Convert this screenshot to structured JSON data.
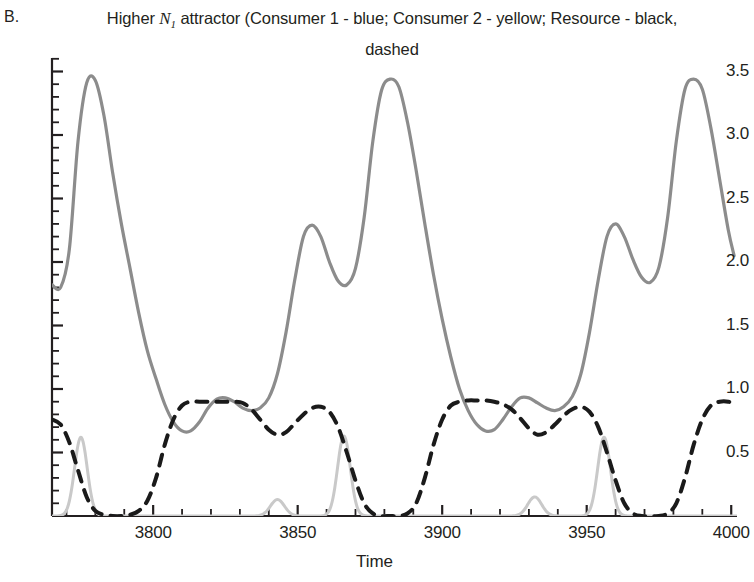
{
  "figure": {
    "panel_label": "B.",
    "title_line1_pre": "Higher ",
    "title_var": "N",
    "title_var_sub": "1",
    "title_line1_post": " attractor (Consumer 1 - blue; Consumer 2 - yellow; Resource -",
    "title_line2": "black, dashed"
  },
  "chart_data": {
    "type": "line",
    "title": "Higher N1 attractor (Consumer 1 - blue; Consumer 2 - yellow; Resource - black, dashed",
    "xlabel": "Time",
    "ylabel": "",
    "xlim": [
      3765,
      4002
    ],
    "ylim": [
      0,
      3.62
    ],
    "grid": false,
    "legend_position": "none",
    "xticks": [
      3800,
      3850,
      3900,
      3950,
      4000
    ],
    "xtick_labels": [
      "3800",
      "3850",
      "3900",
      "3950",
      "4000"
    ],
    "xminor_step": 10,
    "yticks": [
      0.5,
      1.0,
      1.5,
      2.0,
      2.5,
      3.0,
      3.5
    ],
    "ytick_labels": [
      "0.5",
      "1.0",
      "1.5",
      "2.0",
      "2.5",
      "3.0",
      "3.5"
    ],
    "yminor_step": 0.1,
    "colors": {
      "consumer1": "#8c8c8c",
      "consumer2": "#c9c9c9",
      "resource": "#1a1a1a",
      "axis": "#231f20"
    },
    "series": [
      {
        "name": "Consumer 1",
        "legend_color_name": "blue",
        "render_color": "#8c8c8c",
        "style": "solid",
        "linewidth": 3.2,
        "x": [
          3765,
          3768,
          3771,
          3774,
          3777,
          3780,
          3783,
          3786,
          3789,
          3792,
          3795,
          3798,
          3801,
          3804,
          3807,
          3810,
          3813,
          3816,
          3819,
          3822,
          3825,
          3828,
          3831,
          3834,
          3837,
          3840,
          3843,
          3846,
          3849,
          3852,
          3855,
          3858,
          3861,
          3864,
          3867,
          3870,
          3873,
          3876,
          3879,
          3882,
          3885,
          3888,
          3891,
          3894,
          3897,
          3900,
          3903,
          3906,
          3909,
          3912,
          3915,
          3918,
          3921,
          3924,
          3927,
          3930,
          3933,
          3936,
          3939,
          3942,
          3945,
          3948,
          3951,
          3954,
          3957,
          3960,
          3963,
          3966,
          3969,
          3972,
          3975,
          3978,
          3981,
          3984,
          3987,
          3990,
          3993,
          3996,
          3999,
          4001
        ],
        "y": [
          1.82,
          1.8,
          2.1,
          2.95,
          3.41,
          3.43,
          3.15,
          2.7,
          2.3,
          1.95,
          1.6,
          1.3,
          1.08,
          0.88,
          0.74,
          0.67,
          0.67,
          0.74,
          0.85,
          0.92,
          0.93,
          0.9,
          0.85,
          0.83,
          0.85,
          0.93,
          1.12,
          1.45,
          1.86,
          2.2,
          2.29,
          2.2,
          2.0,
          1.85,
          1.82,
          1.95,
          2.35,
          2.95,
          3.35,
          3.44,
          3.38,
          3.1,
          2.72,
          2.3,
          1.9,
          1.55,
          1.25,
          1.0,
          0.83,
          0.72,
          0.67,
          0.68,
          0.76,
          0.86,
          0.93,
          0.93,
          0.89,
          0.85,
          0.83,
          0.86,
          0.94,
          1.12,
          1.45,
          1.86,
          2.2,
          2.3,
          2.2,
          2.02,
          1.88,
          1.84,
          1.96,
          2.35,
          2.95,
          3.36,
          3.44,
          3.36,
          3.05,
          2.65,
          2.25,
          2.05
        ]
      },
      {
        "name": "Consumer 2",
        "legend_color_name": "yellow",
        "render_color": "#c9c9c9",
        "style": "solid",
        "linewidth": 3.0,
        "peaks": [
          {
            "x": 3775,
            "y": 0.62
          },
          {
            "x": 3843,
            "y": 0.13
          },
          {
            "x": 3866,
            "y": 0.63
          },
          {
            "x": 3932,
            "y": 0.15
          },
          {
            "x": 3956,
            "y": 0.62
          }
        ],
        "baseline": 0.0
      },
      {
        "name": "Resource",
        "legend_color_name": "black, dashed",
        "render_color": "#1a1a1a",
        "style": "dashed",
        "dasharray": "11 9",
        "linewidth": 4.0,
        "x": [
          3765,
          3768,
          3771,
          3774,
          3777,
          3780,
          3783,
          3786,
          3789,
          3792,
          3795,
          3798,
          3801,
          3804,
          3807,
          3810,
          3813,
          3816,
          3819,
          3822,
          3825,
          3828,
          3831,
          3834,
          3837,
          3840,
          3843,
          3846,
          3849,
          3852,
          3855,
          3858,
          3861,
          3864,
          3867,
          3870,
          3873,
          3876,
          3879,
          3882,
          3885,
          3888,
          3891,
          3894,
          3897,
          3900,
          3903,
          3906,
          3909,
          3912,
          3915,
          3918,
          3921,
          3924,
          3927,
          3930,
          3933,
          3936,
          3939,
          3942,
          3945,
          3948,
          3951,
          3954,
          3957,
          3960,
          3963,
          3966,
          3969,
          3972,
          3975,
          3978,
          3981,
          3984,
          3987,
          3990,
          3993,
          3996,
          3999,
          4001
        ],
        "y": [
          0.76,
          0.72,
          0.58,
          0.36,
          0.15,
          0.04,
          0.01,
          0.0,
          0.0,
          0.01,
          0.04,
          0.12,
          0.3,
          0.56,
          0.76,
          0.87,
          0.9,
          0.9,
          0.9,
          0.9,
          0.9,
          0.9,
          0.89,
          0.84,
          0.76,
          0.68,
          0.64,
          0.66,
          0.73,
          0.8,
          0.85,
          0.86,
          0.82,
          0.7,
          0.5,
          0.28,
          0.1,
          0.02,
          0.0,
          0.0,
          0.0,
          0.02,
          0.1,
          0.3,
          0.56,
          0.76,
          0.87,
          0.9,
          0.91,
          0.91,
          0.91,
          0.9,
          0.88,
          0.84,
          0.77,
          0.69,
          0.64,
          0.66,
          0.72,
          0.79,
          0.84,
          0.86,
          0.82,
          0.7,
          0.5,
          0.28,
          0.1,
          0.02,
          0.0,
          0.0,
          0.0,
          0.02,
          0.1,
          0.3,
          0.56,
          0.76,
          0.87,
          0.9,
          0.9,
          0.88
        ]
      }
    ]
  }
}
